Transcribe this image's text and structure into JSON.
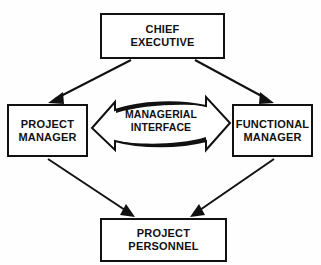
{
  "diagram": {
    "background_color": "#fefefe",
    "line_color": "#111111",
    "nodes": {
      "chief_executive": {
        "label": "CHIEF\nEXECUTIVE"
      },
      "project_manager": {
        "label": "PROJECT\nMANAGER"
      },
      "functional_manager": {
        "label": "FUNCTIONAL\nMANAGER"
      },
      "project_personnel": {
        "label": "PROJECT\nPERSONNEL"
      }
    },
    "center_arrow": {
      "label": "MANAGERIAL\nINTERFACE",
      "direction": "bidirectional"
    },
    "connectors": [
      {
        "name": "chief-executive-to-project-manager",
        "from": "chief_executive",
        "to": "project_manager",
        "style": "solid-arrow"
      },
      {
        "name": "chief-executive-to-functional-manager",
        "from": "chief_executive",
        "to": "functional_manager",
        "style": "solid-arrow"
      },
      {
        "name": "project-manager-to-project-personnel",
        "from": "project_manager",
        "to": "project_personnel",
        "style": "solid-arrow"
      },
      {
        "name": "functional-manager-to-project-personnel",
        "from": "functional_manager",
        "to": "project_personnel",
        "style": "solid-arrow"
      }
    ]
  }
}
